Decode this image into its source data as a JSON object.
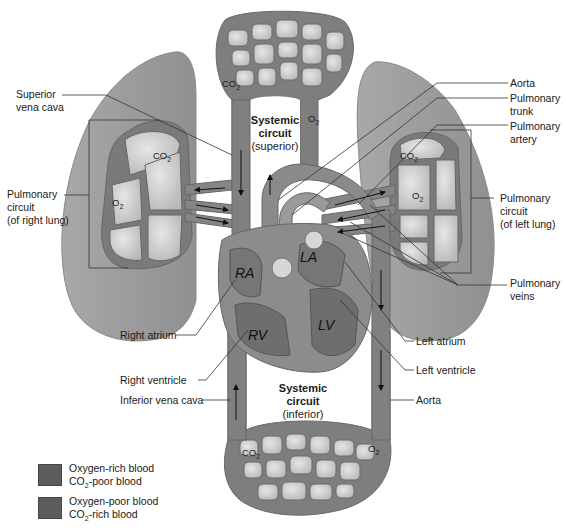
{
  "labels": {
    "superior_vena_cava": [
      "Superior",
      "vena cava"
    ],
    "aorta_top": "Aorta",
    "pulmonary_trunk": [
      "Pulmonary",
      "trunk"
    ],
    "pulmonary_artery": [
      "Pulmonary",
      "artery"
    ],
    "pulmonary_veins": [
      "Pulmonary",
      "veins"
    ],
    "right_atrium": "Right atrium",
    "right_ventricle": "Right ventricle",
    "inferior_vena_cava": "Inferior vena cava",
    "left_atrium": "Left atrium",
    "left_ventricle": "Left ventricle",
    "aorta_bottom": "Aorta"
  },
  "circuits": {
    "pulmonary_right": {
      "title": "Pulmonary",
      "title2": "circuit",
      "sub": "(of right lung)"
    },
    "pulmonary_left": {
      "title": "Pulmonary",
      "title2": "circuit",
      "sub": "(of left lung)"
    },
    "systemic_superior": {
      "title": "Systemic",
      "title2": "circuit",
      "sub": "(superior)"
    },
    "systemic_inferior": {
      "title": "Systemic",
      "title2": "circuit",
      "sub": "(inferior)"
    }
  },
  "gas_labels": {
    "co2": "CO",
    "o2": "O",
    "sub2": "2"
  },
  "heart_annotations": {
    "ra": "RA",
    "la": "LA",
    "rv": "RV",
    "lv": "LV"
  },
  "legend": [
    {
      "line1": "Oxygen-rich blood",
      "line2_pre": "CO",
      "line2_sub": "2",
      "line2_post": "-poor blood",
      "color": "#5c5c5c"
    },
    {
      "line1": "Oxygen-poor blood",
      "line2_pre": "CO",
      "line2_sub": "2",
      "line2_post": "-rich blood",
      "color": "#5a5a5a"
    }
  ],
  "colors": {
    "lung": "#9a9a9a",
    "vessel": "#7d7d7d",
    "capillary_bed": "#8a8a8a",
    "alveoli": "#d8d8d8",
    "heart": "#8c8c8c"
  }
}
